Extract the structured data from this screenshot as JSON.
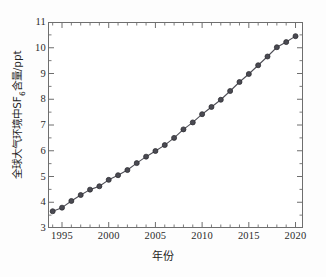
{
  "figure": {
    "background_color": "#ffffff",
    "frame_color": "#6e6e6e"
  },
  "axis": {
    "x_title": "年份",
    "y_title_main": "全球大气环境中SF",
    "y_title_sub": "6",
    "y_title_tail": "含量/ppt",
    "x_tick_labels": [
      "1995",
      "2000",
      "2005",
      "2010",
      "2015",
      "2020"
    ],
    "y_tick_labels": [
      "3",
      "4",
      "5",
      "6",
      "7",
      "8",
      "9",
      "10",
      "11"
    ]
  },
  "chart_data": {
    "type": "line",
    "title": "",
    "subtitle": "",
    "xlabel": "年份",
    "ylabel": "全球大气环境中SF6含量/ppt",
    "xlim": [
      1993.5,
      2020.8
    ],
    "ylim": [
      3,
      11
    ],
    "x_ticks": [
      1995,
      2000,
      2005,
      2010,
      2015,
      2020
    ],
    "y_ticks": [
      3,
      4,
      5,
      6,
      7,
      8,
      9,
      10,
      11
    ],
    "x_minor_ticks_per_interval": 5,
    "y_minor_ticks_per_interval": 2,
    "grid": false,
    "legend": null,
    "legend_position": "none",
    "marker": "circle",
    "marker_color": "#4a4a52",
    "marker_edge_color": "#2f2f33",
    "marker_size_px": 5,
    "line_color": "#4f4f57",
    "line_width_px": 1.1,
    "x": [
      1994,
      1995,
      1996,
      1997,
      1998,
      1999,
      2000,
      2001,
      2002,
      2003,
      2004,
      2005,
      2006,
      2007,
      2008,
      2009,
      2010,
      2011,
      2012,
      2013,
      2014,
      2015,
      2016,
      2017,
      2018,
      2019,
      2020
    ],
    "series": [
      {
        "name": "全球大气环境中SF6含量",
        "unit": "ppt",
        "values": [
          3.65,
          3.79,
          4.05,
          4.28,
          4.49,
          4.62,
          4.87,
          5.05,
          5.25,
          5.52,
          5.77,
          5.99,
          6.22,
          6.5,
          6.83,
          7.1,
          7.42,
          7.7,
          7.98,
          8.32,
          8.67,
          8.98,
          9.32,
          9.66,
          10.02,
          10.22,
          10.45
        ]
      }
    ]
  }
}
